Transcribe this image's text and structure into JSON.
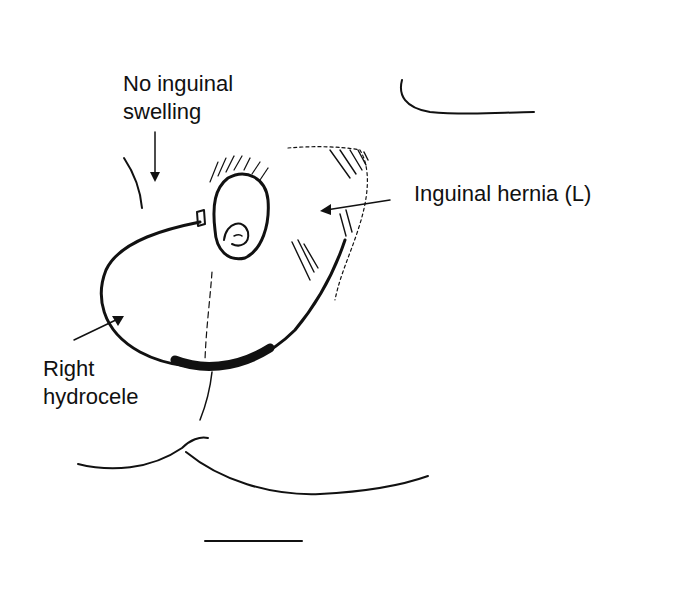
{
  "diagram": {
    "labels": {
      "no_inguinal_line1": "No inguinal",
      "no_inguinal_line2": "swelling",
      "inguinal_hernia": "Inguinal hernia (L)",
      "right_hydrocele_line1": "Right",
      "right_hydrocele_line2": "hydrocele"
    },
    "colors": {
      "ink": "#111111",
      "background": "#ffffff"
    }
  }
}
